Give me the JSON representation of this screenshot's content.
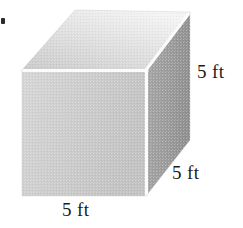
{
  "figure": {
    "shape": "cube",
    "projection": "oblique-3d",
    "unit": "ft",
    "edge_length": "5",
    "faces": {
      "front": {
        "name": "front-face",
        "fill": "#cdcdcd"
      },
      "top": {
        "name": "top-face",
        "fill": "#e3e3e3"
      },
      "right": {
        "name": "right-face",
        "fill": "#9b9b9b"
      }
    },
    "edge_highlight_color": "#fbfbfb",
    "background_color": "#ffffff"
  },
  "labels": {
    "height": "5 ft",
    "depth": "5 ft",
    "width": "5 ft"
  },
  "marks": {
    "bullet": ""
  }
}
